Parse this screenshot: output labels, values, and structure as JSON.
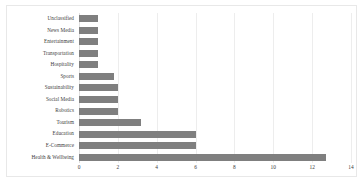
{
  "chart_data": {
    "type": "bar",
    "orientation": "horizontal",
    "title": "",
    "xlabel": "",
    "ylabel": "",
    "xlim": [
      0,
      14
    ],
    "grid": true,
    "legend": false,
    "bar_color": "#7f7f7f",
    "categories": [
      "Unclassified",
      "News Media",
      "Entertainment",
      "Transportation",
      "Hospitality",
      "Sports",
      "Sustainability",
      "Social Media",
      "Robotics",
      "Tourism",
      "Education",
      "E-Commerce",
      "Health & Wellbeing"
    ],
    "values": [
      1,
      1,
      1,
      1,
      1,
      1.8,
      2,
      2,
      2,
      3.2,
      6,
      6,
      12.7
    ],
    "xticks": [
      0,
      2,
      4,
      6,
      8,
      10,
      12,
      14
    ],
    "xticklabels": [
      "0",
      "2",
      "4",
      "6",
      "8",
      "10",
      "12",
      "14"
    ]
  }
}
